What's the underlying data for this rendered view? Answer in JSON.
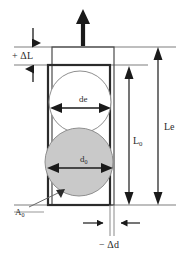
{
  "figure": {
    "background_color": "#ffffff",
    "width": 189,
    "height": 263
  },
  "labels": {
    "delta_l": "+ ΔL",
    "de": "de",
    "d0_text": "d",
    "d0_sub": "0",
    "l0_text": "L",
    "l0_sub": "0",
    "le": "Le",
    "a0_text": "A",
    "a0_sub": "0",
    "delta_d": "− Δd"
  },
  "colors": {
    "stroke_dark": "#2b2b2b",
    "stroke_thin": "#555555",
    "reference_line": "#9b9b9b",
    "circle_fill_gray": "#c9c9c9",
    "circle_outline": "#8a8a8a",
    "circle_fill_white": "#ffffff",
    "arrow_black": "#1a1a1a"
  },
  "shapes": {
    "outer_rect": {
      "x": 52,
      "y": 47,
      "width": 62,
      "height": 158,
      "stroke_width": 1
    },
    "inner_rect": {
      "x": 48,
      "y": 65,
      "width": 62,
      "height": 140,
      "stroke_width": 2
    },
    "circle_de": {
      "cx": 80,
      "cy": 102,
      "r": 31,
      "fill": "#ffffff"
    },
    "circle_d0": {
      "cx": 79,
      "cy": 162,
      "r": 34,
      "fill": "#c9c9c9"
    },
    "load_arrow": {
      "x": 83,
      "y_top": 12,
      "y_bottom": 46,
      "direction": "up"
    }
  },
  "dimensions": {
    "delta_l_span": {
      "y_top": 47,
      "y_bottom": 65
    },
    "l0_arrow": {
      "x": 129,
      "y_top": 66,
      "y_bottom": 205
    },
    "le_arrow": {
      "x": 158,
      "y_top": 47,
      "y_bottom": 205
    },
    "de_arrow": {
      "y": 108,
      "x_left": 51,
      "x_right": 110
    },
    "d0_arrow": {
      "y": 168,
      "x_left": 48,
      "x_right": 112
    },
    "delta_d_span": {
      "y": 223,
      "x_left": 83,
      "x_right": 140
    }
  }
}
